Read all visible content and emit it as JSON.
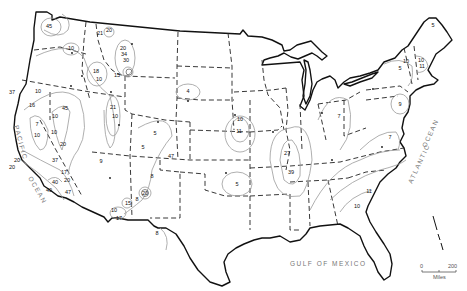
{
  "map": {
    "type": "contour map of contiguous United States",
    "water_labels": {
      "pacific_1": "PACIFIC",
      "pacific_2": "OCEAN",
      "atlantic_1": "ATLANTIC",
      "atlantic_2": "OCEAN",
      "gulf": "GULF OF MEXICO"
    },
    "scale_bar": {
      "start": "0",
      "end": "200",
      "unit": "Miles"
    },
    "contour_labels": [
      {
        "value": "45",
        "region": "northwest Washington",
        "x": 49,
        "y": 26
      },
      {
        "value": "10",
        "region": "eastern Washington",
        "x": 71,
        "y": 48
      },
      {
        "value": "21",
        "region": "northern Idaho",
        "x": 100,
        "y": 34
      },
      {
        "value": "20",
        "region": "northwest Montana",
        "x": 109,
        "y": 31
      },
      {
        "value": "20",
        "region": "western Montana",
        "x": 123,
        "y": 49
      },
      {
        "value": "34",
        "region": "western Montana",
        "x": 124,
        "y": 54
      },
      {
        "value": "30",
        "region": "western Montana",
        "x": 126,
        "y": 60
      },
      {
        "value": "18",
        "region": "central Idaho",
        "x": 96,
        "y": 72
      },
      {
        "value": "10",
        "region": "central Idaho",
        "x": 99,
        "y": 80
      },
      {
        "value": "15",
        "region": "Yellowstone area",
        "x": 117,
        "y": 75
      },
      {
        "value": "37",
        "region": "northern California coast",
        "x": 12,
        "y": 93
      },
      {
        "value": "10",
        "region": "northeast California",
        "x": 38,
        "y": 92
      },
      {
        "value": "16",
        "region": "northern California",
        "x": 32,
        "y": 106
      },
      {
        "value": "45",
        "region": "Sierra Nevada north",
        "x": 65,
        "y": 108
      },
      {
        "value": "10",
        "region": "Sierra Nevada",
        "x": 55,
        "y": 116
      },
      {
        "value": "7",
        "region": "Sacramento Valley",
        "x": 37,
        "y": 125
      },
      {
        "value": "10",
        "region": "central California",
        "x": 37,
        "y": 136
      },
      {
        "value": "10",
        "region": "Sierra Nevada south",
        "x": 54,
        "y": 133
      },
      {
        "value": "20",
        "region": "eastern California",
        "x": 63,
        "y": 145
      },
      {
        "value": "21",
        "region": "northeast Utah",
        "x": 113,
        "y": 108
      },
      {
        "value": "10",
        "region": "Wasatch",
        "x": 115,
        "y": 117
      },
      {
        "value": "9",
        "region": "southwest Utah",
        "x": 101,
        "y": 162
      },
      {
        "value": "20",
        "region": "southern California coast",
        "x": 17,
        "y": 161
      },
      {
        "value": "20",
        "region": "southern California coast",
        "x": 12,
        "y": 168
      },
      {
        "value": "37",
        "region": "Los Angeles",
        "x": 55,
        "y": 161
      },
      {
        "value": "17",
        "region": "southern California",
        "x": 64,
        "y": 172
      },
      {
        "value": "20",
        "region": "southern California",
        "x": 67,
        "y": 180
      },
      {
        "value": "40",
        "region": "southern California coast",
        "x": 55,
        "y": 183
      },
      {
        "value": "40",
        "region": "San Diego area",
        "x": 49,
        "y": 191
      },
      {
        "value": "47",
        "region": "Imperial Valley",
        "x": 68,
        "y": 193
      },
      {
        "value": "4",
        "region": "western South Dakota",
        "x": 188,
        "y": 92
      },
      {
        "value": "5",
        "region": "Colorado Front Range",
        "x": 155,
        "y": 134
      },
      {
        "value": "5",
        "region": "central Colorado",
        "x": 143,
        "y": 148
      },
      {
        "value": "47",
        "region": "southeast Colorado",
        "x": 171,
        "y": 157
      },
      {
        "value": "8",
        "region": "New Mexico",
        "x": 152,
        "y": 177
      },
      {
        "value": "20",
        "region": "southern New Mexico",
        "x": 145,
        "y": 193
      },
      {
        "value": "15",
        "region": "southwest New Mexico",
        "x": 128,
        "y": 203
      },
      {
        "value": "8",
        "region": "southern New Mexico",
        "x": 137,
        "y": 199
      },
      {
        "value": "10",
        "region": "southeast Arizona",
        "x": 114,
        "y": 210
      },
      {
        "value": "17",
        "region": "southeast Arizona",
        "x": 119,
        "y": 218
      },
      {
        "value": "8",
        "region": "west Texas",
        "x": 157,
        "y": 233
      },
      {
        "value": "11",
        "region": "Nebraska-Iowa",
        "x": 239,
        "y": 131
      },
      {
        "value": "10",
        "region": "Nebraska-Iowa",
        "x": 240,
        "y": 119
      },
      {
        "value": "5",
        "region": "Oklahoma",
        "x": 237,
        "y": 184
      },
      {
        "value": "27",
        "region": "New Madrid region",
        "x": 287,
        "y": 153
      },
      {
        "value": "39",
        "region": "lower Mississippi",
        "x": 291,
        "y": 172
      },
      {
        "value": "7",
        "region": "Ohio",
        "x": 339,
        "y": 116
      },
      {
        "value": "9",
        "region": "Pennsylvania",
        "x": 400,
        "y": 104
      },
      {
        "value": "7",
        "region": "Virginia",
        "x": 390,
        "y": 137
      },
      {
        "value": "11",
        "region": "South Carolina",
        "x": 369,
        "y": 191
      },
      {
        "value": "10",
        "region": "Georgia",
        "x": 357,
        "y": 206
      },
      {
        "value": "5",
        "region": "Maine north",
        "x": 433,
        "y": 25
      },
      {
        "value": "5",
        "region": "upstate New York",
        "x": 400,
        "y": 68
      },
      {
        "value": "10",
        "region": "New Hampshire",
        "x": 421,
        "y": 61
      },
      {
        "value": "11",
        "region": "New Hampshire",
        "x": 422,
        "y": 66
      },
      {
        "value": "10",
        "region": "Vermont",
        "x": 406,
        "y": 61
      }
    ]
  }
}
